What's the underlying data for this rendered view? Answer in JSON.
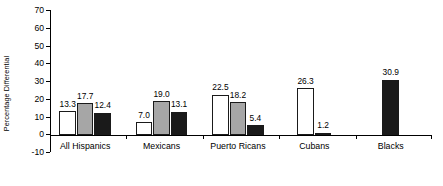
{
  "chart_data": {
    "type": "bar",
    "title": "",
    "xlabel": "",
    "ylabel": "Percentage Differential",
    "ylim": [
      -10,
      70
    ],
    "ytick_step": 10,
    "yticks": [
      -10,
      0,
      10,
      20,
      30,
      40,
      50,
      60,
      70
    ],
    "ytick_labels": [
      "-10",
      "0",
      "10",
      "20",
      "30",
      "40",
      "50",
      "60",
      "70"
    ],
    "grid": false,
    "legend": "none",
    "categories": [
      "All Hispanics",
      "Mexicans",
      "Puerto Ricans",
      "Cubans",
      "Blacks"
    ],
    "series": [
      {
        "name": "series-1",
        "color": "#ffffff",
        "values": [
          13.3,
          7.0,
          22.5,
          26.3,
          null
        ]
      },
      {
        "name": "series-2",
        "color": "#a6a6a6",
        "values": [
          17.7,
          19.0,
          18.2,
          null,
          null
        ]
      },
      {
        "name": "series-3",
        "color": "#1a1a1a",
        "values": [
          12.4,
          13.1,
          5.4,
          1.2,
          30.9
        ]
      }
    ],
    "data_labels": [
      [
        "13.3",
        "17.7",
        "12.4"
      ],
      [
        "7.0",
        "19.0",
        "13.1"
      ],
      [
        "22.5",
        "18.2",
        "5.4"
      ],
      [
        "26.3",
        "1.2"
      ],
      [
        "30.9"
      ]
    ],
    "colors": {
      "series_1_fill": "#ffffff",
      "series_2_fill": "#a6a6a6",
      "series_3_fill": "#1a1a1a",
      "bar_outline": "#1a1a1a",
      "axis": "#000000",
      "text": "#000000",
      "background": "#ffffff"
    }
  }
}
